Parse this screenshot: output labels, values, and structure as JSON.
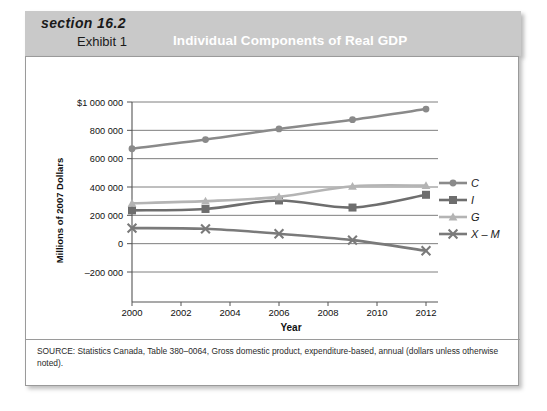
{
  "header": {
    "section": "section 16.2",
    "exhibit": "Exhibit 1",
    "title": "Individual Components of Real GDP"
  },
  "source": {
    "note": "SOURCE: Statistics Canada, Table 380–0064, Gross domestic product, expenditure-based, annual (dollars unless otherwise noted)."
  },
  "legend": {
    "items": [
      {
        "label": "C",
        "marker": "circle-marker",
        "color": "#8a8a8a"
      },
      {
        "label": "I",
        "marker": "square-marker",
        "color": "#6e6e6e"
      },
      {
        "label": "G",
        "marker": "triangle-marker",
        "color": "#b4b4b4"
      },
      {
        "label": "X – M",
        "marker": "x-marker",
        "color": "#7a7a7a"
      }
    ]
  },
  "axes": {
    "y_ticks": [
      "$1 000 000",
      "800 000",
      "600 000",
      "400 000",
      "200 000",
      "0",
      "–200 000"
    ],
    "x_ticks": [
      "2000",
      "2002",
      "2004",
      "2006",
      "2008",
      "2010",
      "2012"
    ],
    "x_title": "Year",
    "y_title": "Millions of 2007 Dollars"
  },
  "chart_data": {
    "type": "line",
    "title": "Individual Components of Real GDP",
    "xlabel": "Year",
    "ylabel": "Millions of 2007 Dollars",
    "x": [
      2000,
      2003,
      2006,
      2009,
      2012
    ],
    "xlim": [
      2000,
      2012
    ],
    "ylim": [
      -200000,
      1000000
    ],
    "ytick_values": [
      1000000,
      800000,
      600000,
      400000,
      200000,
      0,
      -200000
    ],
    "xtick_values": [
      2000,
      2002,
      2004,
      2006,
      2008,
      2010,
      2012
    ],
    "grid": true,
    "legend_position": "right",
    "series": [
      {
        "name": "C",
        "color": "#8a8a8a",
        "marker": "circle",
        "values": [
          670000,
          735000,
          810000,
          875000,
          950000
        ]
      },
      {
        "name": "I",
        "color": "#6e6e6e",
        "marker": "square",
        "values": [
          235000,
          245000,
          305000,
          255000,
          345000
        ]
      },
      {
        "name": "G",
        "color": "#b4b4b4",
        "marker": "triangle",
        "values": [
          285000,
          300000,
          330000,
          405000,
          410000
        ]
      },
      {
        "name": "X – M",
        "color": "#7a7a7a",
        "marker": "x",
        "values": [
          110000,
          105000,
          70000,
          25000,
          -50000
        ]
      }
    ]
  }
}
